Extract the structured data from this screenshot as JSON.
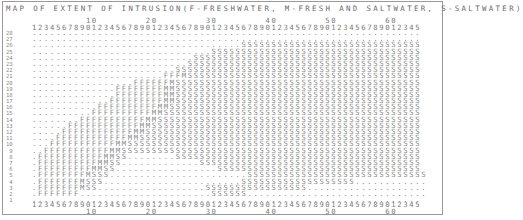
{
  "title": "MAP OF EXTENT OF INTRUSION(F-FRESHWATER, M-FRESH AND SALTWATER, S-SALTWATER)",
  "axis": {
    "top_tens": "         10        20        30        40        50        60",
    "ones": "12345678901234567890123456789012345678901234567890123456789012345",
    "bottom_tens": "         10        20        30        40        50        60"
  },
  "legend": {
    "F": "FRESHWATER",
    "M": "FRESH AND SALTWATER",
    "S": "SALTWATER"
  },
  "grid": {
    "columns": 65,
    "rows": [
      {
        "label": "28",
        "cells": "................................................................."
      },
      {
        "label": "27",
        "cells": "................................................................."
      },
      {
        "label": "26",
        "cells": "...................................SSSSSSSSSSSSSSSSSSSSSSSSSSSSSS"
      },
      {
        "label": "25",
        "cells": "..............................SSSSSSSSSSSSSSSSSSSSSSSSSSSSSSSSSSS"
      },
      {
        "label": "24",
        "cells": "...........................SSSSSSSSSSSSSSSSSSSSSSSSSSSSSSSSSSSSSS"
      },
      {
        "label": "23",
        "cells": "..........................SSSSSSSSSSSSSSSSSSSSSSSSSSSSSSSSSSSSSSS"
      },
      {
        "label": "22",
        "cells": "........................SSSSSSSSSSSSSSSSSSSSSSSSSSSSSSSSSSSSSSSSS"
      },
      {
        "label": "21",
        "cells": "......................FFFMSSSSSSSSSSSSSSSSSSSSSSSSSSSSSSSSSSSSSSS"
      },
      {
        "label": "20",
        "cells": ".................FFFFFFMSSSSSSSSSSSSSSSSSSSSSSSSSSSSSSSSSSSSSSSSS"
      },
      {
        "label": "19",
        "cells": "..............FFFFFFFFMMSSSSSSSSSSSSSSSSSSSSSSSSSSSSSSSSSSSSSSSSS"
      },
      {
        "label": "18",
        "cells": "..............FFFFFFFFMMSSSSSSSSSSSSSSSSSSSSSSSSSSSSSSSSSSSSSSSSS"
      },
      {
        "label": "17",
        "cells": ".............FFFFFFFFFMMSSSSSSSSSSSSSSSSSSSSSSSSSSSSSSSSSSSSSSSSS"
      },
      {
        "label": "16",
        "cells": "...........FFFFFFFFFFMMSSSSSSSSSSSSSSSSSSSSSSSSSSSSSSSSSSSSSSSSSS"
      },
      {
        "label": "15",
        "cells": "..........FFFFFFFFFFMMSSSSSSSSSSSSSSSSSSSSSSSSSSSSSSSSSSSSSSSSSSS"
      },
      {
        "label": "14",
        "cells": "........FFFFFFFFFFFMMSSSSSSSSSSSSSSSSSSSSSSSSSSSSSSSSSSSSSSSSSSSS"
      },
      {
        "label": "13",
        "cells": "......FFFFFFFFFFFFMMSSSSSSSSSSSSSSSSSSSSSSSSSSSSSSSSSSSSSSSSSSSSS"
      },
      {
        "label": "12",
        "cells": ".....FFFFFFFFFFFFMMSSSSSSSSSSSSSSSSSSSSSSSSSSSSSSSSSSSSSSSSSSSSSS"
      },
      {
        "label": "11",
        "cells": "....FFFFFFFFFFFFMMSSSSSSSSSSSSSSSSSSSSSSSSSSSSSSSSSSSSSSSSSSSSSSS"
      },
      {
        "label": "10",
        "cells": "...FFFFFFFFFFFMMSSSSSSSSSSSSSSSSSSSSSSSSSSSSSSSSSSSSSSSSSSSSSSSSS"
      },
      {
        "label": " 9",
        "cells": "..FFFFFFFFFFFMMSSSSSSSSSSSSSSSSSSSSSSSSSSSSSSSSSSSSSSSSSSSSSSSSSS"
      },
      {
        "label": " 8",
        "cells": ".FFFFFFFFFFFMMSS........SSSSSSSSSSSSSSSSSSSSSSSSSSSSSSSSSSSSSSSSS"
      },
      {
        "label": " 7",
        "cells": ".FFFFFFFFFFMMSS.............SSSSSSSSSSSSSSSSSSSSSSSSSSSSSSSSSSSSS"
      },
      {
        "label": " 6",
        "cells": ".FFFFFFFFFMMSS.................SSSSSSSSSSSSSSSSSSSSSSSSSSSSSSSSSS"
      },
      {
        "label": " 5",
        "cells": ".FFFFFFFFMSSS.......................SSSSSSSSSSSSSSSSSSSSSSSSSSSSSS"
      },
      {
        "label": " 4",
        "cells": ".FFFFFFFMSSS.......................SSSSSSSSSSSSSSSSSSS............"
      },
      {
        "label": " 3",
        "cells": ".FFFFFFFMSS..................SSSSSSSSSSSSSSSSS...................."
      },
      {
        "label": " 2",
        "cells": ".FFFFFFF......................SSSSSS.............................."
      },
      {
        "label": " 1",
        "cells": "................................................................."
      }
    ]
  }
}
